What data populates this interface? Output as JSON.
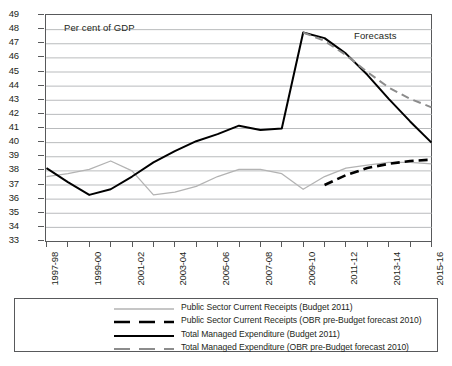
{
  "annotations": {
    "units": "Per cent of GDP",
    "forecasts": "Forecasts"
  },
  "legend": {
    "items": [
      {
        "label": "Public Sector Current Receipts (Budget 2011)",
        "style": "solid",
        "color": "#b3b3b3",
        "width": 1.3,
        "name": "legend-receipts-budget-2011"
      },
      {
        "label": "Public Sector Current Receipts (OBR pre-Budget forecast 2010)",
        "style": "dashed",
        "color": "#000000",
        "width": 2.6,
        "name": "legend-receipts-obr-2010"
      },
      {
        "label": "Total Managed Expenditure (Budget 2011)",
        "style": "solid",
        "color": "#000000",
        "width": 2.0,
        "name": "legend-tme-budget-2011"
      },
      {
        "label": "Total Managed Expenditure (OBR pre-Budget forecast 2010)",
        "style": "dashed",
        "color": "#8c8c8c",
        "width": 2.0,
        "name": "legend-tme-obr-2010"
      }
    ]
  },
  "chart_data": {
    "type": "line",
    "title": "",
    "xlabel": "",
    "ylabel": "Per cent of GDP",
    "ylim": [
      33,
      49
    ],
    "ytick_step": 1,
    "yticks": [
      33,
      34,
      35,
      36,
      37,
      38,
      39,
      40,
      41,
      42,
      43,
      44,
      45,
      46,
      47,
      48,
      49
    ],
    "grid": true,
    "legend_position": "below",
    "x": [
      "1997-98",
      "1998-99",
      "1999-00",
      "2000-01",
      "2001-02",
      "2002-03",
      "2003-04",
      "2004-05",
      "2005-06",
      "2006-07",
      "2007-08",
      "2008-09",
      "2009-10",
      "2010-11",
      "2011-12",
      "2012-13",
      "2013-14",
      "2014-15",
      "2015-16"
    ],
    "xtick_labels_shown": [
      "1997-98",
      "1999-00",
      "2001-02",
      "2003-04",
      "2005-06",
      "2007-08",
      "2009-10",
      "2011-12",
      "2013-14",
      "2015-16"
    ],
    "series": [
      {
        "name": "Public Sector Current Receipts (Budget 2011)",
        "style": "solid",
        "color": "#b3b3b3",
        "values": [
          37.6,
          37.8,
          38.1,
          38.7,
          38.0,
          36.3,
          36.5,
          36.9,
          37.6,
          38.1,
          38.1,
          37.8,
          36.7,
          37.6,
          38.2,
          38.4,
          38.6,
          38.6,
          38.5
        ]
      },
      {
        "name": "Public Sector Current Receipts (OBR pre-Budget forecast 2010)",
        "style": "dashed",
        "color": "#000000",
        "values": [
          null,
          null,
          null,
          null,
          null,
          null,
          null,
          null,
          null,
          null,
          null,
          null,
          null,
          37.0,
          37.7,
          38.2,
          38.5,
          38.7,
          38.8
        ]
      },
      {
        "name": "Total Managed Expenditure (Budget 2011)",
        "style": "solid",
        "color": "#000000",
        "values": [
          38.2,
          37.2,
          36.3,
          36.7,
          37.6,
          38.6,
          39.4,
          40.1,
          40.6,
          41.2,
          40.9,
          41.0,
          47.8,
          47.4,
          46.3,
          44.8,
          43.1,
          41.5,
          40.0
        ]
      },
      {
        "name": "Total Managed Expenditure (OBR pre-Budget forecast 2010)",
        "style": "dashed",
        "color": "#8c8c8c",
        "values": [
          null,
          null,
          null,
          null,
          null,
          null,
          null,
          null,
          null,
          null,
          null,
          null,
          47.8,
          47.2,
          46.2,
          45.0,
          43.9,
          43.1,
          42.5
        ]
      }
    ]
  }
}
